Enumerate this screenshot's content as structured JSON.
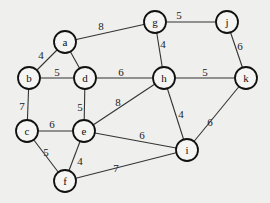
{
  "diagram": {
    "type": "weighted-undirected-graph",
    "node_radius": 11,
    "nodes": [
      {
        "id": "a",
        "label": "a",
        "x": 65,
        "y": 42
      },
      {
        "id": "b",
        "label": "b",
        "x": 29,
        "y": 78
      },
      {
        "id": "d",
        "label": "d",
        "x": 85,
        "y": 78
      },
      {
        "id": "g",
        "label": "g",
        "x": 155,
        "y": 22
      },
      {
        "id": "j",
        "label": "j",
        "x": 227,
        "y": 22
      },
      {
        "id": "h",
        "label": "h",
        "x": 164,
        "y": 78
      },
      {
        "id": "k",
        "label": "k",
        "x": 246,
        "y": 78
      },
      {
        "id": "c",
        "label": "c",
        "x": 27,
        "y": 131
      },
      {
        "id": "e",
        "label": "e",
        "x": 84,
        "y": 131
      },
      {
        "id": "f",
        "label": "f",
        "x": 65,
        "y": 181
      },
      {
        "id": "i",
        "label": "i",
        "x": 187,
        "y": 150
      }
    ],
    "edges": [
      {
        "from": "a",
        "to": "g",
        "weight": "8",
        "lx": 101,
        "ly": 26
      },
      {
        "from": "a",
        "to": "b",
        "weight": "4",
        "lx": 41,
        "ly": 55
      },
      {
        "from": "a",
        "to": "d",
        "weight": "",
        "lx": 0,
        "ly": 0
      },
      {
        "from": "b",
        "to": "d",
        "weight": "5",
        "lx": 57,
        "ly": 72
      },
      {
        "from": "d",
        "to": "h",
        "weight": "6",
        "lx": 121,
        "ly": 72
      },
      {
        "from": "g",
        "to": "j",
        "weight": "5",
        "lx": 179,
        "ly": 15
      },
      {
        "from": "g",
        "to": "h",
        "weight": "4",
        "lx": 163,
        "ly": 44
      },
      {
        "from": "j",
        "to": "k",
        "weight": "6",
        "lx": 240,
        "ly": 46
      },
      {
        "from": "h",
        "to": "k",
        "weight": "5",
        "lx": 205,
        "ly": 72
      },
      {
        "from": "b",
        "to": "c",
        "weight": "7",
        "lx": 22,
        "ly": 106
      },
      {
        "from": "d",
        "to": "e",
        "weight": "5",
        "lx": 80,
        "ly": 107
      },
      {
        "from": "c",
        "to": "e",
        "weight": "6",
        "lx": 52,
        "ly": 124
      },
      {
        "from": "e",
        "to": "h",
        "weight": "8",
        "lx": 118,
        "ly": 102
      },
      {
        "from": "e",
        "to": "i",
        "weight": "6",
        "lx": 142,
        "ly": 135
      },
      {
        "from": "h",
        "to": "i",
        "weight": "4",
        "lx": 181,
        "ly": 114
      },
      {
        "from": "k",
        "to": "i",
        "weight": "6",
        "lx": 210,
        "ly": 122
      },
      {
        "from": "c",
        "to": "f",
        "weight": "5",
        "lx": 46,
        "ly": 152
      },
      {
        "from": "e",
        "to": "f",
        "weight": "4",
        "lx": 80,
        "ly": 161
      },
      {
        "from": "f",
        "to": "i",
        "weight": "7",
        "lx": 116,
        "ly": 168
      }
    ]
  }
}
